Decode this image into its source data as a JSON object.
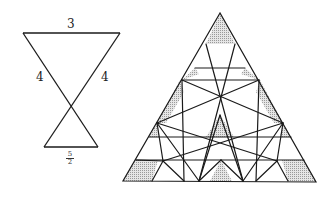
{
  "left_figure": {
    "top_label": "3",
    "left_label": "4",
    "right_label": "4",
    "bottom_label_numerator": "5",
    "bottom_label_denominator": "2"
  },
  "right_figure": {
    "description": "Equilateral triangle subdivided by lines with shaded regions",
    "shade_color": "#c8c8c8",
    "line_color": "#1a1a1a"
  }
}
